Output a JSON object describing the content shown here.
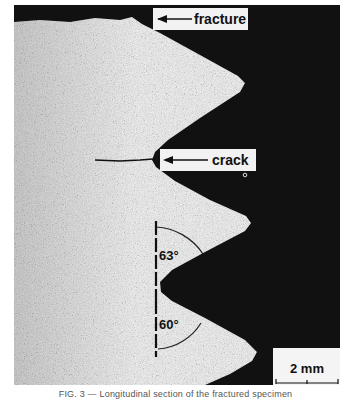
{
  "figure": {
    "type": "micrograph",
    "colors": {
      "background": "#111111",
      "material": "#bdbdbd",
      "label_box": "#f2f2f2"
    },
    "annotations": {
      "fracture_label": "fracture",
      "crack_label": "crack",
      "angle_upper": "63°",
      "angle_lower": "60°",
      "scale_bar": "2 mm"
    }
  },
  "caption": "FIG. 3 — Longitudinal section of the fractured specimen"
}
